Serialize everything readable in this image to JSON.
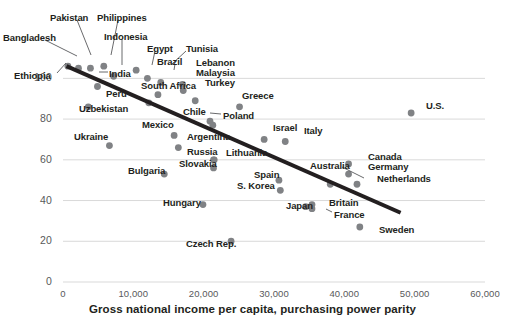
{
  "chart_data": {
    "type": "scatter",
    "title": "",
    "xlabel": "Gross national income per capita, purchasing power parity",
    "ylabel": "",
    "xlim": [
      0,
      60000
    ],
    "ylim": [
      0,
      110
    ],
    "xticks": [
      "0",
      "10,000",
      "20,000",
      "30,000",
      "40,000",
      "50,000",
      "60,000"
    ],
    "xtick_values": [
      0,
      10000,
      20000,
      30000,
      40000,
      50000,
      60000
    ],
    "yticks": [
      "0",
      "20",
      "40",
      "60",
      "80",
      "100"
    ],
    "ytick_values": [
      0,
      20,
      40,
      60,
      80,
      100
    ],
    "grid": "horizontal",
    "legend": "none",
    "dot_color": "#808285",
    "dot_color_dark": "#58595b",
    "trendline_color": "#231f20",
    "trendline": {
      "x0": 500,
      "y0": 106,
      "x1": 48000,
      "y1": 34
    },
    "points": [
      {
        "name": "Ethiopia",
        "x": 700,
        "y": 106,
        "label_x": 14,
        "label_y": 70,
        "leader": [
          57,
          73,
          66,
          63
        ]
      },
      {
        "name": "Bangladesh",
        "x": 2200,
        "y": 105,
        "label_x": 3,
        "label_y": 32,
        "leader": [
          45,
          40,
          77,
          56
        ]
      },
      {
        "name": "Pakistan",
        "x": 3900,
        "y": 105,
        "label_x": 50,
        "label_y": 12,
        "leader": [
          77,
          20,
          91,
          55
        ]
      },
      {
        "name": "Philippines",
        "x": 5800,
        "y": 106,
        "label_x": 97,
        "label_y": 12,
        "leader": [
          118,
          20,
          111,
          55
        ]
      },
      {
        "name": "Indonesia",
        "x": 7200,
        "y": 101,
        "label_x": 104,
        "label_y": 31,
        "leader": [
          122,
          39,
          122,
          65
        ]
      },
      {
        "name": "India",
        "x": 4900,
        "y": 96,
        "label_x": 109,
        "label_y": 68,
        "leader": [
          108,
          72,
          99,
          72
        ]
      },
      {
        "name": "Egypt",
        "x": 10400,
        "y": 104,
        "label_x": 147,
        "label_y": 43,
        "leader": [
          155,
          51,
          152,
          65
        ]
      },
      {
        "name": "Tunisia",
        "x": 12000,
        "y": 100,
        "label_x": 186,
        "label_y": 43,
        "leader": [
          186,
          51,
          172,
          64
        ]
      },
      {
        "name": "Brazil",
        "x": 13900,
        "y": 98,
        "label_x": 157,
        "label_y": 56,
        "leader": [
          175,
          64,
          174,
          70
        ]
      },
      {
        "name": "Lebanon",
        "x": 17000,
        "y": 97,
        "label_x": 196,
        "label_y": 57,
        "leader": null
      },
      {
        "name": "Malaysia",
        "x": 17100,
        "y": 94,
        "label_x": 196,
        "label_y": 67,
        "leader": null
      },
      {
        "name": "Turkey",
        "x": 18800,
        "y": 89,
        "label_x": 205,
        "label_y": 77,
        "leader": null
      },
      {
        "name": "South Africa",
        "x": 13500,
        "y": 92,
        "label_x": 141,
        "label_y": 80,
        "leader": null
      },
      {
        "name": "Peru",
        "x": 12200,
        "y": 88,
        "label_x": 106,
        "label_y": 88,
        "leader": null
      },
      {
        "name": "Uzbekistan",
        "x": 3600,
        "y": 86,
        "label_x": 79,
        "label_y": 103,
        "leader": null
      },
      {
        "name": "Greece",
        "x": 25100,
        "y": 86,
        "label_x": 242,
        "label_y": 90,
        "leader": null
      },
      {
        "name": "Chile",
        "x": 20900,
        "y": 79,
        "label_x": 183,
        "label_y": 106,
        "leader": null
      },
      {
        "name": "Poland",
        "x": 21300,
        "y": 77,
        "label_x": 223,
        "label_y": 110,
        "leader": [
          210,
          113,
          221,
          114
        ]
      },
      {
        "name": "U.S.",
        "x": 49500,
        "y": 83,
        "label_x": 426,
        "label_y": 100,
        "leader": null
      },
      {
        "name": "Mexico",
        "x": 15800,
        "y": 72,
        "label_x": 142,
        "label_y": 119,
        "leader": null
      },
      {
        "name": "Ukraine",
        "x": 6600,
        "y": 67,
        "label_x": 74,
        "label_y": 131,
        "leader": null
      },
      {
        "name": "Israel",
        "x": 28600,
        "y": 70,
        "label_x": 273,
        "label_y": 122,
        "leader": null
      },
      {
        "name": "Italy",
        "x": 31600,
        "y": 69,
        "label_x": 304,
        "label_y": 125,
        "leader": null
      },
      {
        "name": "Argentina",
        "x": 16400,
        "y": 66,
        "label_x": 187,
        "label_y": 131,
        "leader": null
      },
      {
        "name": "Russia",
        "x": 21400,
        "y": 60,
        "label_x": 187,
        "label_y": 146,
        "leader": null
      },
      {
        "name": "Lithuania",
        "x": 21500,
        "y": 60,
        "label_x": 226,
        "label_y": 147,
        "leader": null
      },
      {
        "name": "Slovakia",
        "x": 21400,
        "y": 56,
        "label_x": 179,
        "label_y": 158,
        "leader": null
      },
      {
        "name": "Canada",
        "x": 40600,
        "y": 58,
        "label_x": 368,
        "label_y": 151,
        "leader": null
      },
      {
        "name": "Germany",
        "x": 40600,
        "y": 53,
        "label_x": 368,
        "label_y": 161,
        "leader": null
      },
      {
        "name": "Australia",
        "x": 38000,
        "y": 48,
        "label_x": 310,
        "label_y": 160,
        "leader": [
          342,
          167,
          364,
          178
        ]
      },
      {
        "name": "Netherlands",
        "x": 41800,
        "y": 48,
        "label_x": 377,
        "label_y": 173,
        "leader": null
      },
      {
        "name": "Spain",
        "x": 30700,
        "y": 50,
        "label_x": 254,
        "label_y": 169,
        "leader": null
      },
      {
        "name": "S. Korea",
        "x": 30900,
        "y": 45,
        "label_x": 237,
        "label_y": 180,
        "leader": null
      },
      {
        "name": "Bulgaria",
        "x": 14400,
        "y": 53,
        "label_x": 128,
        "label_y": 165,
        "leader": null
      },
      {
        "name": "Hungary",
        "x": 19900,
        "y": 38,
        "label_x": 163,
        "label_y": 197,
        "leader": null
      },
      {
        "name": "Japan",
        "x": 34500,
        "y": 37,
        "label_x": 286,
        "label_y": 200,
        "leader": null
      },
      {
        "name": "Britain",
        "x": 35400,
        "y": 38,
        "label_x": 329,
        "label_y": 197,
        "leader": null
      },
      {
        "name": "France",
        "x": 35400,
        "y": 36,
        "label_x": 334,
        "label_y": 209,
        "leader": [
          326,
          209,
          332,
          212
        ]
      },
      {
        "name": "Sweden",
        "x": 42200,
        "y": 27,
        "label_x": 379,
        "label_y": 224,
        "leader": null
      },
      {
        "name": "Czech Rep.",
        "x": 23900,
        "y": 20,
        "label_x": 186,
        "label_y": 238,
        "leader": null
      }
    ]
  }
}
